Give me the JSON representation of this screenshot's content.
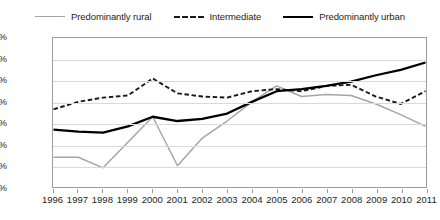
{
  "chart_data": {
    "type": "line",
    "title": "",
    "xlabel": "",
    "ylabel": "",
    "grid": true,
    "legend_position": "top-center",
    "x": [
      1996,
      1997,
      1998,
      1999,
      2000,
      2001,
      2002,
      2003,
      2004,
      2005,
      2006,
      2007,
      2008,
      2009,
      2010,
      2011
    ],
    "categories": [
      "1996",
      "1997",
      "1998",
      "1999",
      "2000",
      "2001",
      "2002",
      "2003",
      "2004",
      "2005",
      "2006",
      "2007",
      "2008",
      "2009",
      "2010",
      "2011"
    ],
    "ylim": [
      -0.4,
      1.0
    ],
    "ytick_step": 0.2,
    "ytick_labels": [
      "1.0%",
      "0.8%",
      "0.6%",
      "0.4%",
      "0.2%",
      "0.0%",
      "-0.2%",
      "-0.4%"
    ],
    "ytick_values": [
      1.0,
      0.8,
      0.6,
      0.4,
      0.2,
      0.0,
      -0.2,
      -0.4
    ],
    "unit": "%",
    "series": [
      {
        "name": "Predominantly rural",
        "style": "solid-thin",
        "color": "#a6a6a6",
        "values": [
          -0.12,
          -0.12,
          -0.22,
          0.02,
          0.26,
          -0.2,
          0.06,
          0.22,
          0.4,
          0.55,
          0.45,
          0.47,
          0.46,
          0.38,
          0.28,
          0.17
        ]
      },
      {
        "name": "Intermediate",
        "style": "dashed",
        "color": "#1a1a1a",
        "values": [
          0.33,
          0.4,
          0.44,
          0.46,
          0.62,
          0.48,
          0.45,
          0.44,
          0.5,
          0.52,
          0.5,
          0.55,
          0.56,
          0.45,
          0.38,
          0.5
        ]
      },
      {
        "name": "Predominantly urban",
        "style": "solid-thick",
        "color": "#000000",
        "values": [
          0.14,
          0.12,
          0.11,
          0.17,
          0.26,
          0.22,
          0.24,
          0.29,
          0.4,
          0.5,
          0.52,
          0.55,
          0.59,
          0.65,
          0.7,
          0.77
        ]
      }
    ]
  },
  "legend": {
    "items": [
      {
        "label": "Predominantly rural",
        "swatch": "legend-swatch-rural"
      },
      {
        "label": "Intermediate",
        "swatch": "legend-swatch-intermediate"
      },
      {
        "label": "Predominantly urban",
        "swatch": "legend-swatch-urban"
      }
    ]
  }
}
